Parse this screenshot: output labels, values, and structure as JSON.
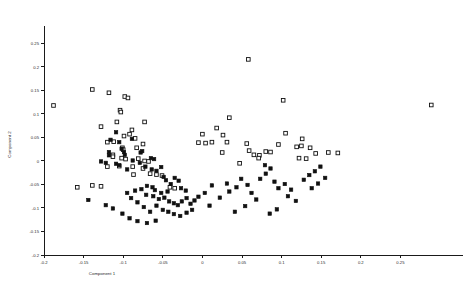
{
  "chart_data": {
    "type": "scatter",
    "title": "",
    "xlabel": "Component 1",
    "ylabel": "Component 2",
    "xlim": [
      -0.2,
      0.3
    ],
    "ylim": [
      -0.2,
      0.27
    ],
    "grid": false,
    "legend": "none",
    "xticks": [
      -0.2,
      -0.15,
      -0.1,
      -0.05,
      0,
      0.05,
      0.1,
      0.15,
      0.2,
      0.25
    ],
    "xticklabels": [
      "-0.2",
      "-0.15",
      "-0.1",
      "-0.05",
      "0",
      "0.05",
      "0.1",
      "0.15",
      "0.2",
      "0.25"
    ],
    "yticks": [
      -0.2,
      -0.15,
      -0.1,
      -0.05,
      0,
      0.05,
      0.1,
      0.15,
      0.2,
      0.25
    ],
    "yticklabels": [
      "-0.2",
      "-0.15",
      "-0.1",
      "-0.05",
      "0",
      "0.05",
      "0.1",
      "0.15",
      "0.2",
      "0.25"
    ],
    "series": [
      {
        "name": "open-square-group",
        "marker": "open-square",
        "color": "#101010",
        "points": [
          [
            -0.188,
            0.118
          ],
          [
            -0.139,
            0.152
          ],
          [
            -0.118,
            0.145
          ],
          [
            -0.098,
            0.137
          ],
          [
            -0.094,
            0.134
          ],
          [
            -0.104,
            0.108
          ],
          [
            -0.103,
            0.104
          ],
          [
            -0.128,
            0.073
          ],
          [
            -0.108,
            0.083
          ],
          [
            -0.089,
            0.066
          ],
          [
            -0.092,
            0.057
          ],
          [
            -0.099,
            0.053
          ],
          [
            -0.085,
            0.048
          ],
          [
            -0.073,
            0.083
          ],
          [
            -0.12,
            0.04
          ],
          [
            -0.112,
            0.041
          ],
          [
            -0.101,
            0.028
          ],
          [
            -0.1,
            0.024
          ],
          [
            -0.113,
            0.013
          ],
          [
            -0.113,
            0.009
          ],
          [
            -0.102,
            0.006
          ],
          [
            -0.097,
            0.004
          ],
          [
            -0.083,
            0.028
          ],
          [
            -0.075,
            0.036
          ],
          [
            -0.081,
            0.005
          ],
          [
            -0.073,
            0.0
          ],
          [
            -0.068,
            -0.001
          ],
          [
            -0.12,
            -0.012
          ],
          [
            -0.105,
            -0.011
          ],
          [
            -0.088,
            -0.012
          ],
          [
            -0.075,
            -0.016
          ],
          [
            -0.087,
            -0.029
          ],
          [
            -0.066,
            -0.027
          ],
          [
            -0.058,
            -0.029
          ],
          [
            -0.051,
            -0.031
          ],
          [
            -0.041,
            -0.056
          ],
          [
            -0.035,
            -0.058
          ],
          [
            -0.139,
            -0.052
          ],
          [
            -0.128,
            -0.054
          ],
          [
            -0.158,
            -0.056
          ],
          [
            0.018,
            0.07
          ],
          [
            0.026,
            0.055
          ],
          [
            0.034,
            0.092
          ],
          [
            0.0,
            0.057
          ],
          [
            -0.005,
            0.039
          ],
          [
            0.012,
            0.04
          ],
          [
            0.004,
            0.038
          ],
          [
            0.031,
            0.04
          ],
          [
            0.025,
            0.018
          ],
          [
            0.056,
            0.037
          ],
          [
            0.059,
            0.022
          ],
          [
            0.065,
            0.013
          ],
          [
            0.072,
            0.012
          ],
          [
            0.071,
            0.006
          ],
          [
            0.08,
            0.02
          ],
          [
            0.086,
            0.019
          ],
          [
            0.047,
            -0.005
          ],
          [
            0.102,
            0.129
          ],
          [
            0.105,
            0.059
          ],
          [
            0.126,
            0.047
          ],
          [
            0.096,
            0.035
          ],
          [
            0.119,
            0.03
          ],
          [
            0.125,
            0.032
          ],
          [
            0.136,
            0.028
          ],
          [
            0.143,
            0.016
          ],
          [
            0.159,
            0.018
          ],
          [
            0.131,
            0.005
          ],
          [
            0.122,
            0.006
          ],
          [
            0.171,
            0.017
          ],
          [
            0.058,
            0.216
          ],
          [
            0.289,
            0.119
          ]
        ]
      },
      {
        "name": "filled-square-group",
        "marker": "filled-square",
        "color": "#101010",
        "points": [
          [
            -0.109,
            0.061
          ],
          [
            -0.116,
            0.045
          ],
          [
            -0.105,
            0.04
          ],
          [
            -0.102,
            0.026
          ],
          [
            -0.099,
            0.019
          ],
          [
            -0.098,
            0.013
          ],
          [
            -0.089,
            0.047
          ],
          [
            -0.118,
            0.019
          ],
          [
            -0.118,
            0.012
          ],
          [
            -0.128,
            -0.001
          ],
          [
            -0.122,
            -0.004
          ],
          [
            -0.109,
            -0.006
          ],
          [
            -0.105,
            -0.009
          ],
          [
            -0.095,
            -0.018
          ],
          [
            -0.088,
            0.001
          ],
          [
            -0.078,
            0.018
          ],
          [
            -0.076,
            0.021
          ],
          [
            -0.079,
            -0.004
          ],
          [
            -0.072,
            -0.012
          ],
          [
            -0.065,
            0.006
          ],
          [
            -0.061,
            0.004
          ],
          [
            -0.064,
            -0.018
          ],
          [
            -0.058,
            -0.021
          ],
          [
            -0.052,
            -0.013
          ],
          [
            -0.049,
            -0.034
          ],
          [
            -0.046,
            -0.041
          ],
          [
            -0.04,
            -0.049
          ],
          [
            -0.035,
            -0.036
          ],
          [
            -0.03,
            -0.042
          ],
          [
            -0.027,
            -0.058
          ],
          [
            -0.021,
            -0.063
          ],
          [
            -0.044,
            -0.065
          ],
          [
            -0.052,
            -0.068
          ],
          [
            -0.06,
            -0.062
          ],
          [
            -0.063,
            -0.056
          ],
          [
            -0.07,
            -0.053
          ],
          [
            -0.077,
            -0.06
          ],
          [
            -0.085,
            -0.063
          ],
          [
            -0.071,
            -0.072
          ],
          [
            -0.062,
            -0.075
          ],
          [
            -0.055,
            -0.081
          ],
          [
            -0.048,
            -0.078
          ],
          [
            -0.042,
            -0.086
          ],
          [
            -0.036,
            -0.09
          ],
          [
            -0.031,
            -0.094
          ],
          [
            -0.026,
            -0.086
          ],
          [
            -0.02,
            -0.079
          ],
          [
            -0.015,
            -0.091
          ],
          [
            -0.01,
            -0.084
          ],
          [
            -0.005,
            -0.076
          ],
          [
            0.003,
            -0.068
          ],
          [
            -0.058,
            -0.095
          ],
          [
            -0.05,
            -0.104
          ],
          [
            -0.043,
            -0.108
          ],
          [
            -0.036,
            -0.113
          ],
          [
            -0.028,
            -0.117
          ],
          [
            -0.02,
            -0.11
          ],
          [
            -0.013,
            -0.104
          ],
          [
            -0.066,
            -0.108
          ],
          [
            -0.074,
            -0.098
          ],
          [
            -0.082,
            -0.088
          ],
          [
            -0.09,
            -0.079
          ],
          [
            -0.095,
            -0.068
          ],
          [
            -0.144,
            -0.083
          ],
          [
            -0.122,
            -0.094
          ],
          [
            -0.113,
            -0.101
          ],
          [
            -0.101,
            -0.112
          ],
          [
            -0.092,
            -0.122
          ],
          [
            -0.082,
            -0.128
          ],
          [
            -0.07,
            -0.132
          ],
          [
            -0.059,
            -0.127
          ],
          [
            0.012,
            -0.052
          ],
          [
            0.009,
            -0.095
          ],
          [
            0.022,
            -0.078
          ],
          [
            0.034,
            -0.065
          ],
          [
            0.031,
            -0.048
          ],
          [
            0.043,
            -0.056
          ],
          [
            0.049,
            -0.038
          ],
          [
            0.057,
            -0.051
          ],
          [
            0.062,
            -0.068
          ],
          [
            0.068,
            -0.082
          ],
          [
            0.041,
            -0.108
          ],
          [
            0.054,
            -0.096
          ],
          [
            0.073,
            -0.038
          ],
          [
            0.08,
            -0.027
          ],
          [
            0.086,
            -0.016
          ],
          [
            0.079,
            -0.009
          ],
          [
            0.091,
            -0.044
          ],
          [
            0.096,
            -0.058
          ],
          [
            0.104,
            -0.049
          ],
          [
            0.112,
            -0.061
          ],
          [
            0.108,
            -0.075
          ],
          [
            0.118,
            -0.085
          ],
          [
            0.128,
            -0.04
          ],
          [
            0.135,
            -0.03
          ],
          [
            0.142,
            -0.022
          ],
          [
            0.149,
            -0.012
          ],
          [
            0.138,
            -0.058
          ],
          [
            0.146,
            -0.048
          ],
          [
            0.155,
            -0.036
          ],
          [
            0.094,
            -0.103
          ],
          [
            0.085,
            -0.112
          ]
        ]
      }
    ]
  }
}
